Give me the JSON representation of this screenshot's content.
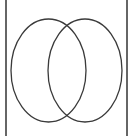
{
  "diagram": {
    "type": "venn",
    "sets": [
      {
        "id": "left-set",
        "cx": 48.5,
        "cy": 70.5,
        "rx": 37.5,
        "ry": 51.5
      },
      {
        "id": "right-set",
        "cx": 85,
        "cy": 70.5,
        "rx": 37,
        "ry": 51.5
      }
    ],
    "border": {
      "left_x": 6,
      "right_x": 127
    },
    "colors": {
      "stroke": "#3a3a3a",
      "border": "#333333",
      "background": "#ffffff"
    }
  }
}
